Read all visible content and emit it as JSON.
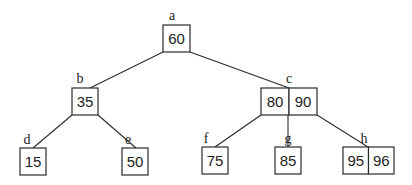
{
  "diagram": {
    "type": "2-3 tree",
    "nodes": [
      {
        "id": "a",
        "label": "a",
        "keys": [
          "60"
        ],
        "x": 163,
        "y": 25,
        "w": 27,
        "h": 27,
        "label_x": 172,
        "label_y": 20
      },
      {
        "id": "b",
        "label": "b",
        "keys": [
          "35"
        ],
        "x": 72,
        "y": 88,
        "w": 26,
        "h": 27,
        "label_x": 80,
        "label_y": 83
      },
      {
        "id": "c",
        "label": "c",
        "keys": [
          "80",
          "90"
        ],
        "x": 261,
        "y": 88,
        "w": 56,
        "h": 27,
        "label_x": 289,
        "label_y": 83
      },
      {
        "id": "d",
        "label": "d",
        "keys": [
          "15"
        ],
        "x": 20,
        "y": 148,
        "w": 26,
        "h": 27,
        "label_x": 27,
        "label_y": 144
      },
      {
        "id": "e",
        "label": "e",
        "keys": [
          "50"
        ],
        "x": 122,
        "y": 148,
        "w": 26,
        "h": 27,
        "label_x": 128,
        "label_y": 144
      },
      {
        "id": "f",
        "label": "f",
        "keys": [
          "75"
        ],
        "x": 202,
        "y": 147,
        "w": 26,
        "h": 27,
        "label_x": 206,
        "label_y": 143
      },
      {
        "id": "g",
        "label": "g",
        "keys": [
          "85"
        ],
        "x": 275,
        "y": 147,
        "w": 26,
        "h": 27,
        "label_x": 288,
        "label_y": 143
      },
      {
        "id": "h",
        "label": "h",
        "keys": [
          "95",
          "96"
        ],
        "x": 343,
        "y": 147,
        "w": 51,
        "h": 27,
        "label_x": 364,
        "label_y": 143
      }
    ],
    "edges": [
      {
        "from": "a",
        "to": "b",
        "x1": 163,
        "y1": 52,
        "x2": 90,
        "y2": 88
      },
      {
        "from": "a",
        "to": "c",
        "x1": 190,
        "y1": 52,
        "x2": 289,
        "y2": 88
      },
      {
        "from": "b",
        "to": "d",
        "x1": 72,
        "y1": 115,
        "x2": 33,
        "y2": 148
      },
      {
        "from": "b",
        "to": "e",
        "x1": 98,
        "y1": 115,
        "x2": 136,
        "y2": 148
      },
      {
        "from": "c",
        "to": "f",
        "x1": 261,
        "y1": 115,
        "x2": 215,
        "y2": 147
      },
      {
        "from": "c",
        "to": "g",
        "x1": 288,
        "y1": 115,
        "x2": 288,
        "y2": 147
      },
      {
        "from": "c",
        "to": "h",
        "x1": 317,
        "y1": 115,
        "x2": 368,
        "y2": 147
      }
    ]
  }
}
